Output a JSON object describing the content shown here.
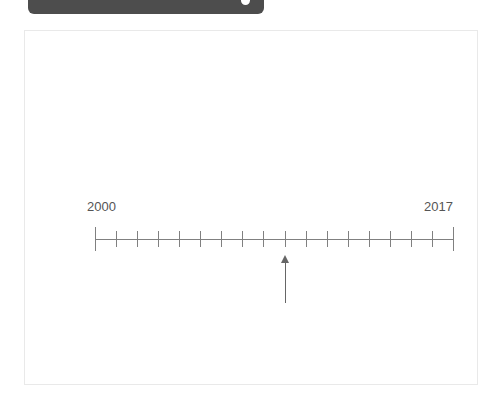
{
  "top_bar": {
    "name": "toolbar-pill",
    "color": "#4d4d4d",
    "knob_color": "#ffffff"
  },
  "panel": {
    "border_color": "#e9e9e9",
    "background": "#ffffff"
  },
  "timeline": {
    "start_label": "2000",
    "end_label": "2017",
    "start_value": 2000,
    "end_value": 2017,
    "tick_count": 18,
    "interval_count": 17,
    "axis_color": "#808080",
    "label_color": "#555555",
    "marker": {
      "value": 2009,
      "index": 9,
      "direction": "up",
      "color": "#666666"
    }
  },
  "chart_data": {
    "type": "line",
    "title": "",
    "xlabel": "",
    "ylabel": "",
    "x": [
      2000,
      2001,
      2002,
      2003,
      2004,
      2005,
      2006,
      2007,
      2008,
      2009,
      2010,
      2011,
      2012,
      2013,
      2014,
      2015,
      2016,
      2017
    ],
    "tick_labels": [
      "2000",
      "",
      "",
      "",
      "",
      "",
      "",
      "",
      "",
      "",
      "",
      "",
      "",
      "",
      "",
      "",
      "",
      "2017"
    ],
    "xlim": [
      2000,
      2017
    ],
    "grid": false,
    "annotations": [
      {
        "label": "",
        "x": 2009,
        "marker": "up-arrow"
      }
    ]
  }
}
